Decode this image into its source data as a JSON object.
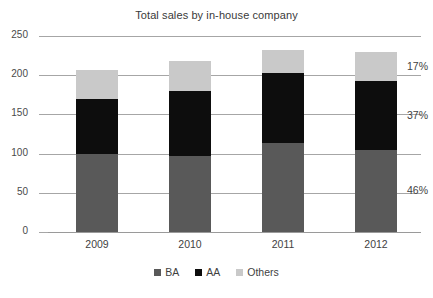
{
  "chart_data": {
    "type": "bar",
    "subtype": "stacked-column",
    "title": "Total sales by in-house company",
    "xlabel": "",
    "ylabel": "",
    "categories": [
      "2009",
      "2010",
      "2011",
      "2012"
    ],
    "ylim": [
      0,
      250
    ],
    "yticks": [
      0,
      50,
      100,
      150,
      200,
      250
    ],
    "ytick_labels": [
      "0",
      "50",
      "100",
      "150",
      "200",
      "250"
    ],
    "grid": true,
    "grid_axis": "y",
    "legend_position": "bottom",
    "series": [
      {
        "name": "BA",
        "color": "#595959",
        "values": [
          100,
          97,
          113,
          105
        ]
      },
      {
        "name": "AA",
        "color": "#0d0d0d",
        "values": [
          70,
          83,
          90,
          87
        ]
      },
      {
        "name": "Others",
        "color": "#c9c9c9",
        "values": [
          37,
          38,
          29,
          38
        ]
      }
    ],
    "totals": [
      207,
      218,
      232,
      230
    ],
    "annotations": [
      {
        "text": "17%",
        "series": "Others",
        "category": "2012"
      },
      {
        "text": "37%",
        "series": "AA",
        "category": "2012"
      },
      {
        "text": "46%",
        "series": "BA",
        "category": "2012"
      }
    ]
  },
  "legend": {
    "items": [
      {
        "label": "BA"
      },
      {
        "label": "AA"
      },
      {
        "label": "Others"
      }
    ]
  }
}
